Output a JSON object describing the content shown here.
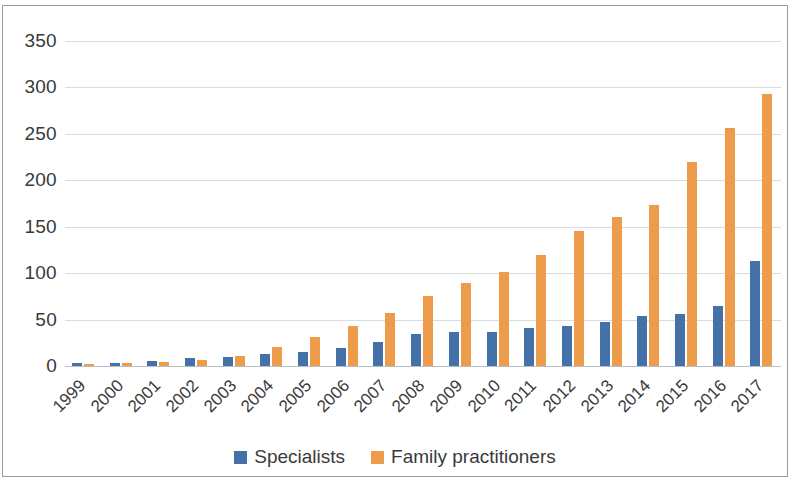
{
  "chart_data": {
    "type": "bar",
    "title": "",
    "xlabel": "",
    "ylabel": "",
    "ylim": [
      0,
      350
    ],
    "yticks": [
      0,
      50,
      100,
      150,
      200,
      250,
      300,
      350
    ],
    "grid": true,
    "legend_position": "bottom",
    "categories": [
      "1999",
      "2000",
      "2001",
      "2002",
      "2003",
      "2004",
      "2005",
      "2006",
      "2007",
      "2008",
      "2009",
      "2010",
      "2011",
      "2012",
      "2013",
      "2014",
      "2015",
      "2016",
      "2017"
    ],
    "series": [
      {
        "name": "Specialists",
        "color": "#4472a8",
        "values": [
          3,
          3,
          5,
          9,
          10,
          13,
          15,
          19,
          26,
          34,
          37,
          37,
          41,
          43,
          47,
          54,
          56,
          65,
          113
        ]
      },
      {
        "name": "Family practitioners",
        "color": "#ed9c4c",
        "values": [
          2,
          3,
          4,
          7,
          11,
          21,
          31,
          43,
          57,
          75,
          89,
          101,
          120,
          145,
          160,
          173,
          220,
          256,
          293
        ]
      }
    ]
  }
}
